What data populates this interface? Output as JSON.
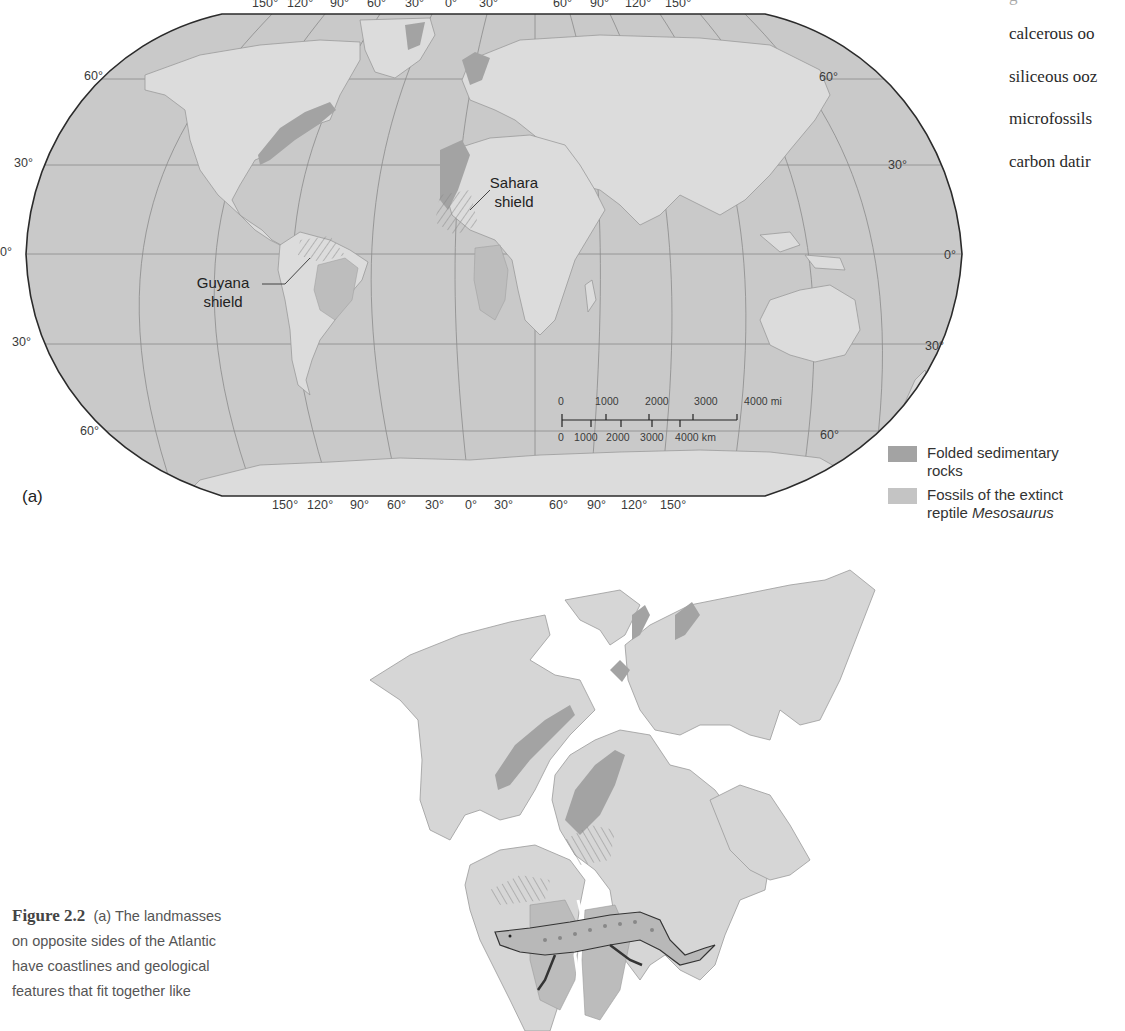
{
  "figure": {
    "number": "Figure 2.2",
    "caption_lines": [
      "(a) The landmasses",
      "on opposite sides of the Atlantic",
      "have coastlines and geological",
      "features that fit together like"
    ]
  },
  "glossary_fragments": [
    "calcerous oo",
    "siliceous ooz",
    "microfossils",
    "carbon datir"
  ],
  "map_a": {
    "panel_label": "(a)",
    "longitude_ticks_top": [
      "150°",
      "120°",
      "90°",
      "60°",
      "30°",
      "0°",
      "30°",
      "60°",
      "90°",
      "120°",
      "150°"
    ],
    "longitude_ticks_bottom": [
      "150°",
      "120°",
      "90°",
      "60°",
      "30°",
      "0°",
      "30°",
      "60°",
      "90°",
      "120°",
      "150°"
    ],
    "latitude_labels_left": [
      "60°",
      "30°",
      "0°",
      "30°",
      "60°"
    ],
    "latitude_labels_right": [
      "60°",
      "30°",
      "0°",
      "30°",
      "60°"
    ],
    "annotations": {
      "sahara": [
        "Sahara",
        "shield"
      ],
      "guyana": [
        "Guyana",
        "shield"
      ]
    },
    "scale_bar": {
      "miles_ticks": [
        "0",
        "1000",
        "2000",
        "3000",
        "4000 mi"
      ],
      "km_ticks": [
        "0",
        "1000",
        "2000",
        "3000",
        "4000 km"
      ]
    },
    "colors": {
      "ocean": "#c9c9c9",
      "land": "#dcdcdc",
      "folded_rocks": "#a3a3a3",
      "fossils": "#bdbdbd",
      "outline": "#2b2b2b",
      "graticule": "#8a8a8a"
    }
  },
  "legend": {
    "items": [
      {
        "label_line1": "Folded sedimentary",
        "label_line2": "rocks",
        "swatch": "#a3a3a3"
      },
      {
        "label_line1": "Fossils of the extinct",
        "label_line2_prefix": "reptile ",
        "label_line2_italic": "Mesosaurus",
        "swatch": "#c4c4c4"
      }
    ]
  },
  "map_b": {
    "description": "Pre-drift reconstruction of continents joined across the Atlantic, with Mesosaurus illustration",
    "colors": {
      "land": "#d6d6d6",
      "folded_rocks": "#a3a3a3",
      "fossils": "#bcbcbc",
      "coast": "#9a9a9a"
    }
  }
}
